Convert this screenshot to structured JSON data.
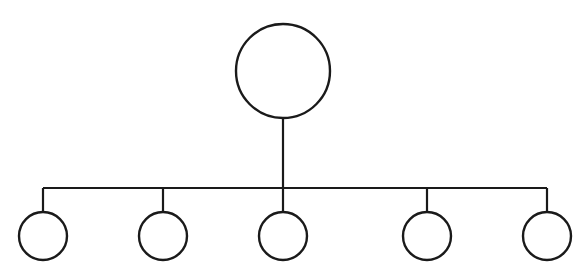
{
  "diagram": {
    "type": "tree-hierarchy",
    "width": 584,
    "height": 276,
    "background": "#ffffff",
    "stroke_color": "#1a1a1a",
    "root": {
      "id": "root",
      "cx": 283,
      "cy": 71,
      "r": 47
    },
    "bus": {
      "y": 188,
      "x1": 43,
      "x2": 547
    },
    "children": [
      {
        "id": "child-1",
        "cx": 43,
        "cy": 236,
        "r": 24
      },
      {
        "id": "child-2",
        "cx": 163,
        "cy": 236,
        "r": 24
      },
      {
        "id": "child-3",
        "cx": 283,
        "cy": 236,
        "r": 24
      },
      {
        "id": "child-4",
        "cx": 427,
        "cy": 236,
        "r": 24
      },
      {
        "id": "child-5",
        "cx": 547,
        "cy": 236,
        "r": 24
      }
    ],
    "labels": []
  }
}
